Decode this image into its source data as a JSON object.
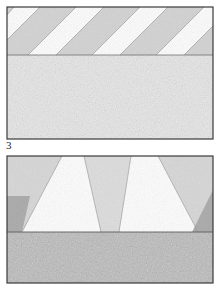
{
  "figure": {
    "label": "3",
    "caption_number": "3",
    "panels": [
      {
        "id": "upper-panel",
        "name": "upper-specimen-panel",
        "pattern": "diagonal-stripes",
        "stripe_angle_deg": 45,
        "stripe_count": 5,
        "upper_band": {
          "name": "striped-band",
          "height_px": 48,
          "stripe_light_color": "#fbfbfb",
          "stripe_shaded_color": "#cfcfcf"
        },
        "lower_band": {
          "name": "speckled-band",
          "height_px": 84,
          "color": "#e3e3e3"
        },
        "border_color": "#3a3a3a"
      },
      {
        "id": "lower-panel",
        "name": "lower-specimen-panel",
        "pattern": "converging-wedges",
        "wedge_count": 5,
        "upper_band": {
          "name": "wedge-band",
          "height_px": 76,
          "wedge_light_color": "#fbfbfb",
          "wedge_shaded_color": "#d4d4d4",
          "corner_shadow_color": "#a8a8a8"
        },
        "lower_band": {
          "name": "speckled-base-band",
          "height_px": 50,
          "color": "#b9b9b9"
        },
        "border_color": "#3a3a3a"
      }
    ],
    "colors": {
      "background": "#ffffff",
      "frame": "#3a3a3a",
      "light": "#fbfbfb",
      "mid_light": "#e3e3e3",
      "mid": "#cfcfcf",
      "mid_dark": "#b9b9b9",
      "dark": "#a8a8a8",
      "text": "#1a1a1a"
    }
  }
}
